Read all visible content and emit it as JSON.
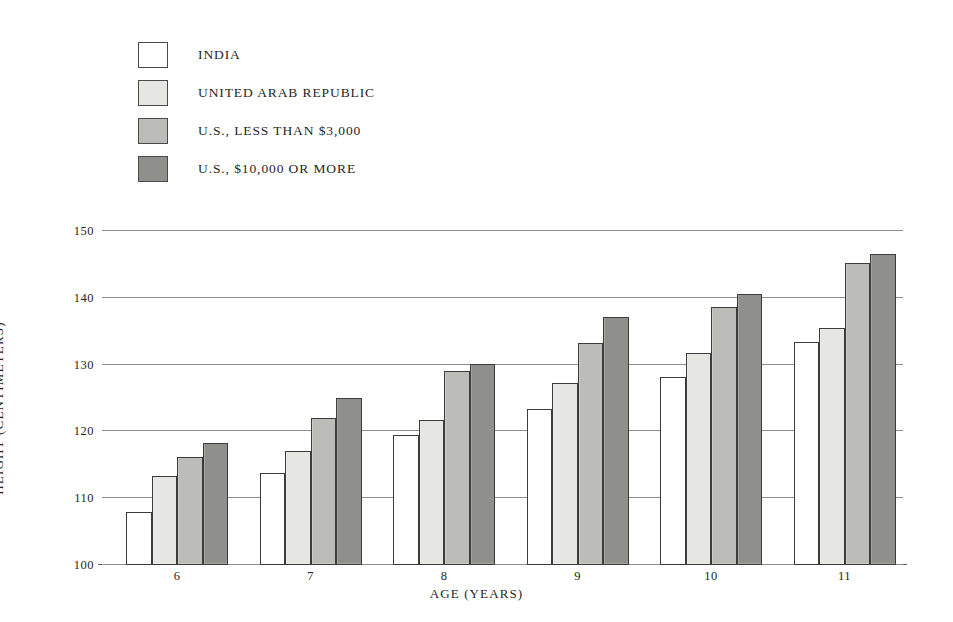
{
  "chart_data": {
    "type": "bar",
    "title": "",
    "xlabel": "AGE (YEARS)",
    "ylabel": "HEIGHT (CENTIMETERS)",
    "categories": [
      "6",
      "7",
      "8",
      "9",
      "10",
      "11"
    ],
    "ylim": [
      100,
      150
    ],
    "yticks": [
      100,
      110,
      120,
      130,
      140,
      150
    ],
    "grid": true,
    "legend_position": "above-plot-left",
    "series": [
      {
        "name": "INDIA",
        "color": "#ffffff",
        "values": [
          108.0,
          113.7,
          119.4,
          123.3,
          128.2,
          133.4
        ]
      },
      {
        "name": "UNITED ARAB REPUBLIC",
        "color": "#e6e6e3",
        "values": [
          113.4,
          117.1,
          121.7,
          127.2,
          131.7,
          135.5
        ]
      },
      {
        "name": "U.S., LESS THAN $3,000",
        "color": "#bcbcb8",
        "values": [
          116.1,
          122.0,
          129.0,
          133.2,
          138.6,
          145.2
        ]
      },
      {
        "name": "U.S., $10,000 OR MORE",
        "color": "#8f8f8b",
        "values": [
          118.3,
          125.0,
          130.1,
          137.2,
          140.6,
          146.5
        ]
      }
    ]
  },
  "legend": {
    "items": [
      {
        "label": "INDIA",
        "color": "#ffffff"
      },
      {
        "label": "UNITED ARAB REPUBLIC",
        "color": "#e6e6e3"
      },
      {
        "label": "U.S., LESS THAN $3,000",
        "color": "#bcbcb8"
      },
      {
        "label": "U.S., $10,000 OR MORE",
        "color": "#8f8f8b"
      }
    ]
  },
  "axes": {
    "y_title": "HEIGHT (CENTIMETERS)",
    "x_title": "AGE (YEARS)",
    "y_tick_labels": [
      "150",
      "140",
      "130",
      "120",
      "110",
      "100"
    ],
    "x_tick_labels": [
      "6",
      "7",
      "8",
      "9",
      "10",
      "11"
    ]
  }
}
